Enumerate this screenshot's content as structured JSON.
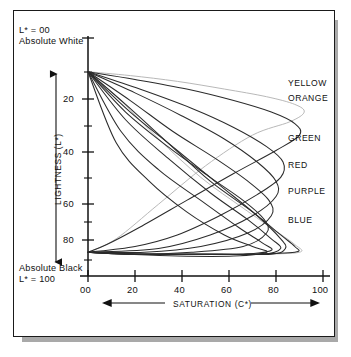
{
  "figure": {
    "top_annotation": {
      "line1": "L* =  00",
      "line2": "Absolute White"
    },
    "bottom_annotation": {
      "line1": "Absolute Black",
      "line2": "L* = 100"
    },
    "lightness_arrow_name": "lightness-direction-arrow",
    "saturation_arrow_name": "saturation-direction-arrow"
  },
  "chart_data": {
    "type": "line",
    "title": "",
    "subtitle": "",
    "xlabel": "SATURATION (C*)",
    "ylabel": "LIGHTNESS (L*)",
    "xlim": [
      0,
      100
    ],
    "ylim": [
      0,
      100
    ],
    "y_axis_inverted": true,
    "grid": false,
    "legend_position": "right-inline",
    "x_ticks": [
      "00",
      "20",
      "40",
      "60",
      "80",
      "100"
    ],
    "x_tick_values": [
      0,
      20,
      40,
      60,
      80,
      100
    ],
    "y_ticks": [
      "20",
      "40",
      "60",
      "80"
    ],
    "y_tick_values": [
      20,
      40,
      60,
      80
    ],
    "y_minor_tick_values": [
      10,
      30,
      50,
      70,
      90
    ],
    "annotations": [
      "L* = 00 Absolute White",
      "Absolute Black L* = 100"
    ],
    "series": [
      {
        "name": "YELLOW",
        "label": "YELLOW",
        "color": "#b4b4b4",
        "peak_saturation": 92,
        "peak_lightness": 22,
        "upper_branch": [
          [
            0,
            3
          ],
          [
            18,
            5
          ],
          [
            38,
            8
          ],
          [
            58,
            12
          ],
          [
            76,
            16
          ],
          [
            88,
            20
          ],
          [
            92,
            24
          ],
          [
            86,
            29
          ],
          [
            70,
            36
          ],
          [
            50,
            52
          ],
          [
            30,
            72
          ],
          [
            12,
            90
          ],
          [
            0,
            97
          ]
        ],
        "lower_branch": [
          [
            0,
            3
          ],
          [
            14,
            18
          ],
          [
            30,
            38
          ],
          [
            48,
            58
          ],
          [
            66,
            74
          ],
          [
            80,
            86
          ],
          [
            88,
            93
          ],
          [
            90,
            97
          ],
          [
            72,
            98
          ],
          [
            46,
            98
          ],
          [
            20,
            98
          ],
          [
            0,
            97
          ]
        ]
      },
      {
        "name": "ORANGE",
        "label": "ORANGE",
        "color": "#2b2b2b",
        "peak_saturation": 90,
        "peak_lightness": 26,
        "upper_branch": [
          [
            0,
            3
          ],
          [
            20,
            7
          ],
          [
            42,
            12
          ],
          [
            62,
            18
          ],
          [
            78,
            24
          ],
          [
            88,
            30
          ],
          [
            90,
            36
          ],
          [
            80,
            44
          ],
          [
            62,
            56
          ],
          [
            42,
            70
          ],
          [
            22,
            84
          ],
          [
            8,
            93
          ],
          [
            0,
            97
          ]
        ],
        "lower_branch": [
          [
            0,
            3
          ],
          [
            16,
            20
          ],
          [
            34,
            40
          ],
          [
            52,
            60
          ],
          [
            70,
            76
          ],
          [
            82,
            88
          ],
          [
            88,
            94
          ],
          [
            88,
            97
          ],
          [
            66,
            98
          ],
          [
            40,
            98
          ],
          [
            16,
            98
          ],
          [
            0,
            97
          ]
        ]
      },
      {
        "name": "GREEN",
        "label": "GREEN",
        "color": "#2b2b2b",
        "peak_saturation": 84,
        "peak_lightness": 44,
        "upper_branch": [
          [
            0,
            3
          ],
          [
            22,
            12
          ],
          [
            44,
            22
          ],
          [
            62,
            32
          ],
          [
            76,
            42
          ],
          [
            83,
            50
          ],
          [
            82,
            58
          ],
          [
            72,
            67
          ],
          [
            56,
            78
          ],
          [
            38,
            88
          ],
          [
            20,
            94
          ],
          [
            0,
            97
          ]
        ],
        "lower_branch": [
          [
            0,
            3
          ],
          [
            18,
            24
          ],
          [
            38,
            44
          ],
          [
            56,
            62
          ],
          [
            72,
            78
          ],
          [
            82,
            90
          ],
          [
            84,
            95
          ],
          [
            78,
            98
          ],
          [
            54,
            98
          ],
          [
            28,
            98
          ],
          [
            0,
            97
          ]
        ]
      },
      {
        "name": "RED",
        "label": "RED",
        "color": "#2b2b2b",
        "peak_saturation": 82,
        "peak_lightness": 54,
        "upper_branch": [
          [
            0,
            3
          ],
          [
            20,
            14
          ],
          [
            40,
            26
          ],
          [
            58,
            38
          ],
          [
            72,
            50
          ],
          [
            80,
            60
          ],
          [
            80,
            68
          ],
          [
            70,
            78
          ],
          [
            52,
            88
          ],
          [
            30,
            95
          ],
          [
            0,
            97
          ]
        ],
        "lower_branch": [
          [
            0,
            3
          ],
          [
            16,
            28
          ],
          [
            34,
            48
          ],
          [
            52,
            66
          ],
          [
            68,
            80
          ],
          [
            78,
            90
          ],
          [
            82,
            95
          ],
          [
            74,
            98
          ],
          [
            48,
            98
          ],
          [
            24,
            98
          ],
          [
            0,
            97
          ]
        ]
      },
      {
        "name": "PURPLE",
        "label": "PURPLE",
        "color": "#2b2b2b",
        "peak_saturation": 80,
        "peak_lightness": 66,
        "upper_branch": [
          [
            0,
            3
          ],
          [
            18,
            18
          ],
          [
            36,
            34
          ],
          [
            54,
            48
          ],
          [
            68,
            60
          ],
          [
            77,
            70
          ],
          [
            78,
            78
          ],
          [
            68,
            87
          ],
          [
            48,
            94
          ],
          [
            24,
            97
          ],
          [
            0,
            97
          ]
        ],
        "lower_branch": [
          [
            0,
            3
          ],
          [
            14,
            34
          ],
          [
            30,
            54
          ],
          [
            48,
            70
          ],
          [
            64,
            84
          ],
          [
            74,
            92
          ],
          [
            78,
            96
          ],
          [
            66,
            98
          ],
          [
            42,
            98
          ],
          [
            20,
            98
          ],
          [
            0,
            97
          ]
        ]
      },
      {
        "name": "BLUE",
        "label": "BLUE",
        "color": "#2b2b2b",
        "peak_saturation": 78,
        "peak_lightness": 80,
        "upper_branch": [
          [
            0,
            3
          ],
          [
            16,
            24
          ],
          [
            34,
            42
          ],
          [
            52,
            58
          ],
          [
            66,
            70
          ],
          [
            75,
            80
          ],
          [
            76,
            87
          ],
          [
            66,
            94
          ],
          [
            44,
            97
          ],
          [
            20,
            98
          ],
          [
            0,
            97
          ]
        ],
        "lower_branch": [
          [
            0,
            3
          ],
          [
            12,
            40
          ],
          [
            26,
            60
          ],
          [
            42,
            76
          ],
          [
            58,
            88
          ],
          [
            70,
            94
          ],
          [
            76,
            97
          ],
          [
            62,
            99
          ],
          [
            38,
            99
          ],
          [
            16,
            98
          ],
          [
            0,
            97
          ]
        ]
      }
    ]
  }
}
